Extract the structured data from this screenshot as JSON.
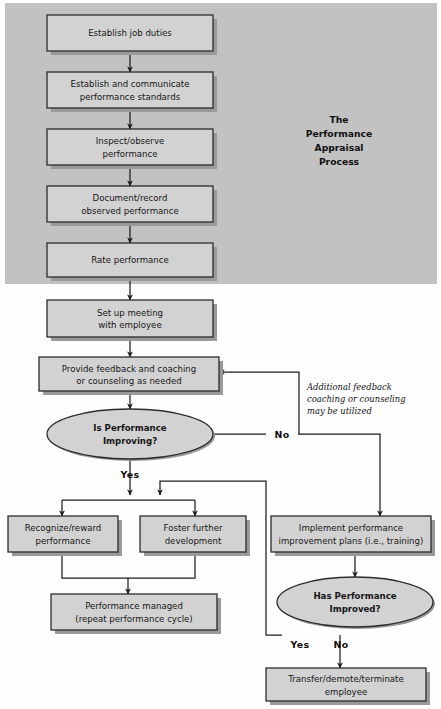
{
  "figure": {
    "title_lines": [
      "The",
      "Performance",
      "Appraisal",
      "Process"
    ],
    "panel_color": "#c2c2c2",
    "node_fill": "#d2d2d2",
    "node_stroke": "#2b2b2b",
    "shadow_color": "#9a9a9a",
    "page_bg": "#fefefe",
    "line_color": "#1d1d1d"
  },
  "nodes": {
    "establish_job_duties": {
      "label": "Establish job duties",
      "shape": "rect"
    },
    "establish_standards": {
      "line1": "Establish and communicate",
      "line2": "performance standards",
      "shape": "rect"
    },
    "inspect_observe": {
      "line1": "Inspect/observe",
      "line2": "performance",
      "shape": "rect"
    },
    "document_record": {
      "line1": "Document/record",
      "line2": "observed performance",
      "shape": "rect"
    },
    "rate_performance": {
      "label": "Rate performance",
      "shape": "rect"
    },
    "set_up_meeting": {
      "line1": "Set up meeting",
      "line2": "with employee",
      "shape": "rect"
    },
    "provide_feedback": {
      "line1": "Provide feedback and coaching",
      "line2": "or counseling as needed",
      "shape": "rect"
    },
    "is_performance_improving": {
      "line1": "Is Performance",
      "line2": "Improving?",
      "shape": "ellipse"
    },
    "recognize_reward": {
      "line1": "Recognize/reward",
      "line2": "performance",
      "shape": "rect"
    },
    "foster_development": {
      "line1": "Foster further",
      "line2": "development",
      "shape": "rect"
    },
    "implement_plans": {
      "line1": "Implement performance",
      "line2": "improvement plans (i.e., training)",
      "shape": "rect"
    },
    "performance_managed": {
      "line1": "Performance managed",
      "line2": "(repeat performance cycle)",
      "shape": "rect"
    },
    "has_performance_improved": {
      "line1": "Has Performance",
      "line2": "Improved?",
      "shape": "ellipse"
    },
    "transfer_demote": {
      "line1": "Transfer/demote/terminate",
      "line2": "employee",
      "shape": "rect"
    }
  },
  "edge_labels": {
    "improving_no": "No",
    "improving_yes": "Yes",
    "improved_yes": "Yes",
    "improved_no": "No"
  },
  "annotation": {
    "line1": "Additional feedback",
    "line2": "coaching or counseling",
    "line3": "may be utilized"
  }
}
